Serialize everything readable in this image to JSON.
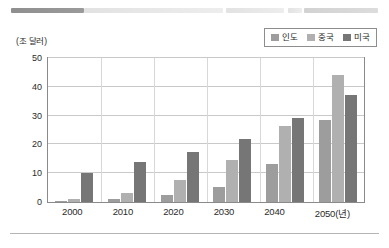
{
  "scan_artifact": {
    "present": true,
    "description": "blurred-redacted-text-line"
  },
  "axis": {
    "unit_label": "(조 달러)",
    "x_axis_suffix_label": "2050(년)"
  },
  "legend": {
    "items": [
      {
        "label": "인도",
        "color": "#9d9d9d",
        "swatch_name": "legend-swatch-india"
      },
      {
        "label": "중국",
        "color": "#b0b0b0",
        "swatch_name": "legend-swatch-china"
      },
      {
        "label": "미국",
        "color": "#767676",
        "swatch_name": "legend-swatch-usa"
      }
    ]
  },
  "chart_data": {
    "type": "bar",
    "title": "",
    "subtitle": "",
    "xlabel": "년",
    "ylabel": "조 달러",
    "unit": "조 달러",
    "categories": [
      "2000",
      "2010",
      "2020",
      "2030",
      "2040",
      "2050"
    ],
    "tick_labels_x": [
      "2000",
      "2010",
      "2020",
      "2030",
      "2040",
      "2050(년)"
    ],
    "tick_labels_y": [
      "0",
      "10",
      "20",
      "30",
      "40",
      "50"
    ],
    "ylim": [
      0,
      50
    ],
    "yticks": [
      0,
      10,
      20,
      30,
      40,
      50
    ],
    "grid": true,
    "grid_axis": "y",
    "legend_position": "top-right",
    "series": [
      {
        "name": "인도",
        "color": "#9d9d9d",
        "values": [
          0.5,
          0.9,
          2.4,
          5.2,
          13.3,
          28.6
        ]
      },
      {
        "name": "중국",
        "color": "#b0b0b0",
        "values": [
          1.2,
          3.0,
          7.6,
          14.7,
          26.5,
          44.0
        ]
      },
      {
        "name": "미국",
        "color": "#767676",
        "values": [
          10.0,
          14.0,
          17.3,
          22.0,
          29.0,
          37.0
        ]
      }
    ]
  },
  "colors": {
    "plot_border": "#8a8a8a",
    "gridline": "#c9c9c9",
    "background": "#ffffff",
    "text": "#2b2b2b"
  }
}
